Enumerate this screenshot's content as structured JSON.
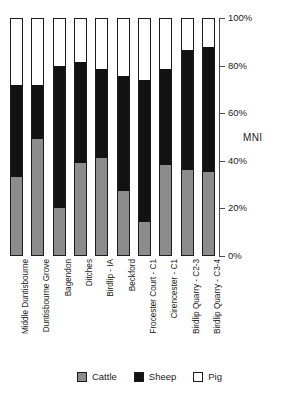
{
  "chart_data": {
    "type": "bar",
    "subtype": "stacked-100-percent",
    "title": "",
    "xlabel": "",
    "ylabel": "MNI",
    "ylim": [
      0,
      100
    ],
    "yticks": [
      "0%",
      "20%",
      "40%",
      "60%",
      "80%",
      "100%"
    ],
    "grid": false,
    "legend_position": "bottom",
    "categories": [
      "Middle Duntisbourne",
      "Duntisbourne Grove",
      "Bagendon",
      "Ditches",
      "Birdlip - IA",
      "Beckford",
      "Frocester Court - C1",
      "Cirencester - C1",
      "Birdlip Quarry - C2-3",
      "Birdlip Quarry - C3-4"
    ],
    "series": [
      {
        "name": "Cattle",
        "color": "#8c8c8c",
        "values": [
          33,
          49,
          20,
          39,
          41,
          27,
          14,
          38,
          36,
          35
        ]
      },
      {
        "name": "Sheep",
        "color": "#121212",
        "values": [
          39,
          23,
          60,
          43,
          38,
          49,
          60,
          41,
          51,
          53
        ]
      },
      {
        "name": "Pig",
        "color": "#ffffff",
        "values": [
          28,
          28,
          20,
          18,
          21,
          24,
          26,
          21,
          13,
          12
        ]
      }
    ]
  },
  "axis": {
    "title": "MNI",
    "ticks": [
      {
        "label": "100%",
        "value": 100
      },
      {
        "label": "80%",
        "value": 80
      },
      {
        "label": "60%",
        "value": 60
      },
      {
        "label": "40%",
        "value": 40
      },
      {
        "label": "20%",
        "value": 20
      },
      {
        "label": "0%",
        "value": 0
      }
    ]
  },
  "legend": {
    "items": [
      {
        "label": "Cattle",
        "color": "#8c8c8c"
      },
      {
        "label": "Sheep",
        "color": "#121212"
      },
      {
        "label": "Pig",
        "color": "#ffffff"
      }
    ]
  }
}
